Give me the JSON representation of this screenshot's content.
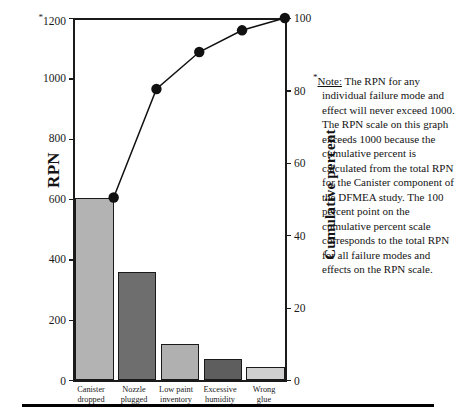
{
  "chart_data": {
    "type": "bar",
    "title": "",
    "subtitle": "",
    "categories": [
      "Canister dropped",
      "Nozzle plugged",
      "Low paint inventory",
      "Excessive humidity",
      "Wrong glue"
    ],
    "series": [
      {
        "name": "RPN",
        "type": "bar",
        "values": [
          605,
          360,
          122,
          72,
          45
        ],
        "axis": "left"
      },
      {
        "name": "Cumulative percent",
        "type": "line",
        "values": [
          50.4,
          80.4,
          90.6,
          96.6,
          100.0
        ],
        "axis": "right"
      }
    ],
    "xlabel": "",
    "ylabel": "RPN",
    "ylabel_right": "Cumulative percent",
    "ylim": [
      0,
      1200
    ],
    "ylim_right": [
      0,
      100
    ],
    "yticks": [
      0,
      200,
      400,
      600,
      800,
      1000,
      1200
    ],
    "yticks_right": [
      0,
      20,
      40,
      60,
      80,
      100
    ],
    "grid": false,
    "legend": "none",
    "bar_colors": [
      "#b3b3b3",
      "#6e6e6e",
      "#b0b0b0",
      "#5e5e5e",
      "#d0d0d0"
    ],
    "line_color": "#111111",
    "marker": "circle"
  },
  "axes": {
    "left_title": "RPN",
    "right_title": "Cumulative percent",
    "left_ticks": [
      "1200",
      "1000",
      "800",
      "600",
      "400",
      "200",
      "0"
    ],
    "left_top_tick_marker": "*",
    "right_ticks": [
      "100",
      "80",
      "60",
      "40",
      "20",
      "0"
    ]
  },
  "categories": [
    {
      "line1": "Canister",
      "line2": "dropped"
    },
    {
      "line1": "Nozzle",
      "line2": "plugged"
    },
    {
      "line1": "Low paint",
      "line2": "inventory"
    },
    {
      "line1": "Excessive",
      "line2": "humidity"
    },
    {
      "line1": "Wrong",
      "line2": "glue"
    }
  ],
  "note": {
    "marker": "*",
    "label": "Note:",
    "text": " The RPN for any individual failure mode and effect will never exceed 1000. The RPN scale on this graph exceeds 1000 because the cumulative percent is calculated from the total RPN for the Canister component of the DFMEA study. The 100 percent point on the cumulative percent scale corresponds to the total RPN for all failure modes and effects on the RPN scale."
  }
}
